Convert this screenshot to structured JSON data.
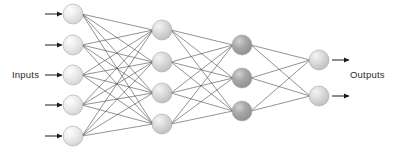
{
  "figure": {
    "background_color": "#ffffff",
    "width": 400,
    "height": 158
  },
  "labels": {
    "inputs": "Inputs",
    "outputs": "Outputs",
    "text_color": "#2b2b2b"
  },
  "style": {
    "edge_color": "#4a4a4a",
    "edge_width": 0.6,
    "arrow_color": "#1a1a1a",
    "node_stroke": "#9b9b9b",
    "node_light_fill": "#e3e3e3",
    "node_light_highlight": "#fbfbfb",
    "node_mid_fill": "#d0d0d0",
    "node_mid_highlight": "#f2f2f2",
    "node_dark_fill": "#9e9e9e",
    "node_dark_highlight": "#cfcfcf",
    "node_radius": 10
  },
  "layers": [
    {
      "name": "input-layer",
      "role": "input",
      "count": 5,
      "x": 73,
      "shade": "light",
      "nodes": [
        {
          "id": "i1",
          "cy": 14
        },
        {
          "id": "i2",
          "cy": 45
        },
        {
          "id": "i3",
          "cy": 75
        },
        {
          "id": "i4",
          "cy": 105
        },
        {
          "id": "i5",
          "cy": 136
        }
      ]
    },
    {
      "name": "hidden-layer-1",
      "role": "hidden",
      "count": 4,
      "x": 162,
      "shade": "mid",
      "nodes": [
        {
          "id": "h1a",
          "cy": 30
        },
        {
          "id": "h1b",
          "cy": 62
        },
        {
          "id": "h1c",
          "cy": 93
        },
        {
          "id": "h1d",
          "cy": 124
        }
      ]
    },
    {
      "name": "hidden-layer-2",
      "role": "hidden",
      "count": 3,
      "x": 242,
      "shade": "dark",
      "nodes": [
        {
          "id": "h2a",
          "cy": 45
        },
        {
          "id": "h2b",
          "cy": 78
        },
        {
          "id": "h2c",
          "cy": 111
        }
      ]
    },
    {
      "name": "output-layer",
      "role": "output",
      "count": 2,
      "x": 319,
      "shade": "mid",
      "nodes": [
        {
          "id": "o1",
          "cy": 60
        },
        {
          "id": "o2",
          "cy": 96
        }
      ]
    }
  ],
  "connections": [
    {
      "from": "input-layer",
      "to": "hidden-layer-1",
      "pattern": "fully-connected",
      "edges": 20
    },
    {
      "from": "hidden-layer-1",
      "to": "hidden-layer-2",
      "pattern": "fully-connected",
      "edges": 12
    },
    {
      "from": "hidden-layer-2",
      "to": "output-layer",
      "pattern": "fully-connected",
      "edges": 6
    }
  ],
  "input_arrows": [
    {
      "id": "in-arrow-1",
      "x1": 45,
      "x2": 62,
      "y": 14
    },
    {
      "id": "in-arrow-2",
      "x1": 45,
      "x2": 62,
      "y": 45
    },
    {
      "id": "in-arrow-3",
      "x1": 45,
      "x2": 62,
      "y": 75
    },
    {
      "id": "in-arrow-4",
      "x1": 45,
      "x2": 62,
      "y": 105
    },
    {
      "id": "in-arrow-5",
      "x1": 45,
      "x2": 62,
      "y": 136
    }
  ],
  "output_arrows": [
    {
      "id": "out-arrow-1",
      "x1": 332,
      "x2": 349,
      "y": 60
    },
    {
      "id": "out-arrow-2",
      "x1": 332,
      "x2": 349,
      "y": 96
    }
  ]
}
